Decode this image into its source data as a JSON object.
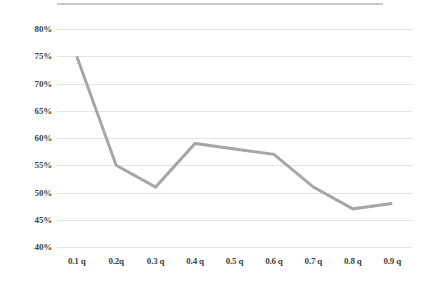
{
  "chart_data": {
    "type": "line",
    "title": "",
    "subtitle": "",
    "xlabel": "",
    "ylabel": "",
    "grid": true,
    "legend": false,
    "legend_position": "none",
    "categories": [
      "0.1 q",
      "0.2q",
      "0.3 q",
      "0.4 q",
      "0.5 q",
      "0.6 q",
      "0.7 q",
      "0.8 q",
      "0.9 q"
    ],
    "values": [
      75,
      55,
      51,
      59,
      58,
      57,
      51,
      47,
      48
    ],
    "value_suffix": "%",
    "ylim": [
      40,
      80
    ],
    "ytick_labels": [
      "80%",
      "75%",
      "70%",
      "65%",
      "60%",
      "55%",
      "50%",
      "45%",
      "40%"
    ],
    "ytick_values": [
      80,
      75,
      70,
      65,
      60,
      55,
      50,
      45,
      40
    ],
    "series": [
      {
        "name": "Series 1",
        "values": [
          75,
          55,
          51,
          59,
          58,
          57,
          51,
          47,
          48
        ]
      }
    ],
    "colors": {
      "line": "#a6a6a6",
      "gridline": "#e3e3e3",
      "axis_text": "#3f3f3f",
      "background": "#ffffff",
      "top_rule": "#c9c9c9"
    },
    "line_width": 3
  },
  "axis": {
    "y": {
      "labels": [
        {
          "text": "80%"
        },
        {
          "text": "75%"
        },
        {
          "text": "70%"
        },
        {
          "text": "65%"
        },
        {
          "text": "60%"
        },
        {
          "text": "55%"
        },
        {
          "text": "50%"
        },
        {
          "text": "45%"
        },
        {
          "text": "40%"
        }
      ]
    },
    "x": {
      "labels": [
        {
          "text": "0.1 q"
        },
        {
          "text": "0.2q"
        },
        {
          "text": "0.3 q"
        },
        {
          "text": "0.4 q"
        },
        {
          "text": "0.5 q"
        },
        {
          "text": "0.6 q"
        },
        {
          "text": "0.7 q"
        },
        {
          "text": "0.8 q"
        },
        {
          "text": "0.9 q"
        }
      ]
    }
  }
}
